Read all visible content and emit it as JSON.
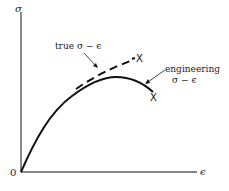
{
  "diagram": {
    "type": "stress-strain curve comparison",
    "axes": {
      "y_label": "σ",
      "x_label": "ϵ",
      "origin_label": "0"
    },
    "curves": [
      {
        "name": "true",
        "label_line1": "true σ − ϵ",
        "style": "dashed",
        "fracture_marker": "X"
      },
      {
        "name": "engineering",
        "label_line1": "engineering",
        "label_line2": "σ − ϵ",
        "style": "solid",
        "fracture_marker": "X"
      }
    ],
    "colors": {
      "line": "#111111",
      "text": "#222222",
      "background": "#ffffff"
    }
  }
}
